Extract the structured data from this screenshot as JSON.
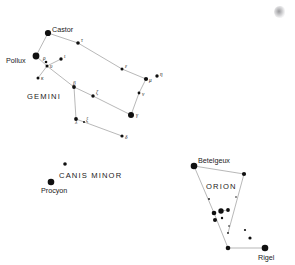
{
  "chart_data": {
    "type": "scatter",
    "title": "",
    "xlabel": "",
    "ylabel": "",
    "xlim": [
      0,
      295
    ],
    "ylim": [
      0,
      265
    ],
    "grid": false,
    "legend": null,
    "constellations": [
      {
        "name": "GEMINI",
        "label_x": 27,
        "label_y": 99,
        "stars": [
          {
            "id": "castor",
            "label": "Castor",
            "label_kind": "name",
            "x": 48,
            "y": 33,
            "r": 3.1,
            "lx": 52,
            "ly": 32
          },
          {
            "id": "pollux",
            "label": "Pollux",
            "label_kind": "name",
            "x": 36,
            "y": 56,
            "r": 3.4,
            "lx": 6,
            "ly": 63
          },
          {
            "id": "rho",
            "label": "ρ",
            "label_kind": "greek",
            "x": 46,
            "y": 62,
            "r": 1.3,
            "lx": 43,
            "ly": 60
          },
          {
            "id": "upsilon",
            "label": "υ",
            "label_kind": "greek",
            "x": 47,
            "y": 66,
            "r": 1.5,
            "lx": 50,
            "ly": 68
          },
          {
            "id": "kappa",
            "label": "κ",
            "label_kind": "greek",
            "x": 38,
            "y": 78,
            "r": 1.5,
            "lx": 41,
            "ly": 80
          },
          {
            "id": "iota",
            "label": "ι",
            "label_kind": "greek",
            "x": 61,
            "y": 59,
            "r": 1.7,
            "lx": 64,
            "ly": 58
          },
          {
            "id": "tau",
            "label": "τ",
            "label_kind": "greek",
            "x": 78,
            "y": 43,
            "r": 1.8,
            "lx": 81,
            "ly": 42
          },
          {
            "id": "epsilon",
            "label": "ε",
            "label_kind": "greek",
            "x": 122,
            "y": 69,
            "r": 1.5,
            "lx": 125,
            "ly": 68
          },
          {
            "id": "mu",
            "label": "μ",
            "label_kind": "greek",
            "x": 146,
            "y": 79,
            "r": 2.1,
            "lx": 149,
            "ly": 82
          },
          {
            "id": "eta",
            "label": "η",
            "label_kind": "greek",
            "x": 157,
            "y": 76,
            "r": 1.7,
            "lx": 160,
            "ly": 76
          },
          {
            "id": "nu",
            "label": "ν",
            "label_kind": "greek",
            "x": 139,
            "y": 93,
            "r": 1.4,
            "lx": 142,
            "ly": 96
          },
          {
            "id": "gamma",
            "label": "γ",
            "label_kind": "greek",
            "x": 131,
            "y": 115,
            "r": 3.0,
            "lx": 136,
            "ly": 117
          },
          {
            "id": "zeta",
            "label": "ζ",
            "label_kind": "greek",
            "x": 93,
            "y": 96,
            "r": 1.7,
            "lx": 96,
            "ly": 94
          },
          {
            "id": "beta2",
            "label": "β",
            "label_kind": "greek",
            "x": 74,
            "y": 87,
            "r": 1.9,
            "lx": 73,
            "ly": 85
          },
          {
            "id": "lambda",
            "label": "λ",
            "label_kind": "greek",
            "x": 76,
            "y": 119,
            "r": 1.9,
            "lx": 75,
            "ly": 124
          },
          {
            "id": "xi",
            "label": "ξ",
            "label_kind": "greek",
            "x": 84,
            "y": 122,
            "r": 1.0,
            "lx": 86,
            "ly": 121
          },
          {
            "id": "delta",
            "label": "δ",
            "label_kind": "greek",
            "x": 122,
            "y": 136,
            "r": 1.6,
            "lx": 125,
            "ly": 139
          }
        ],
        "lines": [
          [
            48,
            33,
            36,
            56
          ],
          [
            48,
            33,
            78,
            43
          ],
          [
            78,
            43,
            122,
            69
          ],
          [
            122,
            69,
            146,
            79
          ],
          [
            146,
            79,
            139,
            93
          ],
          [
            139,
            93,
            131,
            115
          ],
          [
            36,
            56,
            47,
            66
          ],
          [
            61,
            59,
            47,
            66
          ],
          [
            47,
            66,
            38,
            78
          ],
          [
            47,
            66,
            74,
            87
          ],
          [
            74,
            87,
            93,
            96
          ],
          [
            93,
            96,
            131,
            115
          ],
          [
            74,
            87,
            76,
            119
          ],
          [
            76,
            119,
            122,
            136
          ]
        ]
      },
      {
        "name": "CANIS  MINOR",
        "label_x": 59,
        "label_y": 178,
        "stars": [
          {
            "id": "gomeisa",
            "label": "",
            "label_kind": "none",
            "x": 65,
            "y": 164,
            "r": 1.8,
            "lx": 0,
            "ly": 0
          },
          {
            "id": "procyon",
            "label": "Procyon",
            "label_kind": "name",
            "x": 51,
            "y": 182,
            "r": 3.3,
            "lx": 41,
            "ly": 193
          }
        ],
        "lines": []
      },
      {
        "name": "ORION",
        "label_x": 206,
        "label_y": 189,
        "stars": [
          {
            "id": "betelgeux",
            "label": "Betelgeux",
            "label_kind": "name",
            "x": 194,
            "y": 166,
            "r": 3.3,
            "lx": 198,
            "ly": 163
          },
          {
            "id": "bellatrix",
            "label": "",
            "label_kind": "none",
            "x": 244,
            "y": 174,
            "r": 2.1,
            "lx": 0,
            "ly": 0
          },
          {
            "id": "ori-n1",
            "label": "",
            "label_kind": "none",
            "x": 209,
            "y": 199,
            "r": 0.9,
            "lx": 0,
            "ly": 0
          },
          {
            "id": "ori-n2",
            "label": "",
            "label_kind": "none",
            "x": 236,
            "y": 197,
            "r": 0.8,
            "lx": 0,
            "ly": 0
          },
          {
            "id": "alnitak",
            "label": "",
            "label_kind": "none",
            "x": 214,
            "y": 213,
            "r": 2.3,
            "lx": 0,
            "ly": 0
          },
          {
            "id": "alnilam",
            "label": "",
            "label_kind": "none",
            "x": 221,
            "y": 211,
            "r": 2.7,
            "lx": 0,
            "ly": 0
          },
          {
            "id": "mintaka",
            "label": "",
            "label_kind": "none",
            "x": 228,
            "y": 210,
            "r": 1.9,
            "lx": 0,
            "ly": 0
          },
          {
            "id": "ori-s1",
            "label": "",
            "label_kind": "none",
            "x": 215,
            "y": 220,
            "r": 2.0,
            "lx": 0,
            "ly": 0
          },
          {
            "id": "ori-s2",
            "label": "",
            "label_kind": "none",
            "x": 222,
            "y": 218,
            "r": 1.2,
            "lx": 0,
            "ly": 0
          },
          {
            "id": "ori-sw1",
            "label": "",
            "label_kind": "none",
            "x": 229,
            "y": 226,
            "r": 0.8,
            "lx": 0,
            "ly": 0
          },
          {
            "id": "ori-sw2",
            "label": "",
            "label_kind": "none",
            "x": 228,
            "y": 233,
            "r": 0.9,
            "lx": 0,
            "ly": 0
          },
          {
            "id": "saiph",
            "label": "",
            "label_kind": "none",
            "x": 228,
            "y": 248,
            "r": 2.3,
            "lx": 0,
            "ly": 0
          },
          {
            "id": "ori-e1",
            "label": "",
            "label_kind": "none",
            "x": 245,
            "y": 230,
            "r": 1.1,
            "lx": 0,
            "ly": 0
          },
          {
            "id": "ori-e2",
            "label": "",
            "label_kind": "none",
            "x": 250,
            "y": 238,
            "r": 1.6,
            "lx": 0,
            "ly": 0
          },
          {
            "id": "rigel",
            "label": "Rigel",
            "label_kind": "name",
            "x": 265,
            "y": 248,
            "r": 3.3,
            "lx": 258,
            "ly": 260
          }
        ],
        "lines": [
          [
            194,
            166,
            244,
            174
          ],
          [
            194,
            166,
            214,
            213
          ],
          [
            244,
            174,
            228,
            233
          ],
          [
            214,
            213,
            228,
            248
          ],
          [
            228,
            248,
            265,
            248
          ],
          [
            221,
            211,
            228,
            210
          ]
        ]
      }
    ]
  },
  "artifacts": {
    "corner_smudge": {
      "name": "corner-smudge",
      "x": 274,
      "y": 6
    }
  }
}
